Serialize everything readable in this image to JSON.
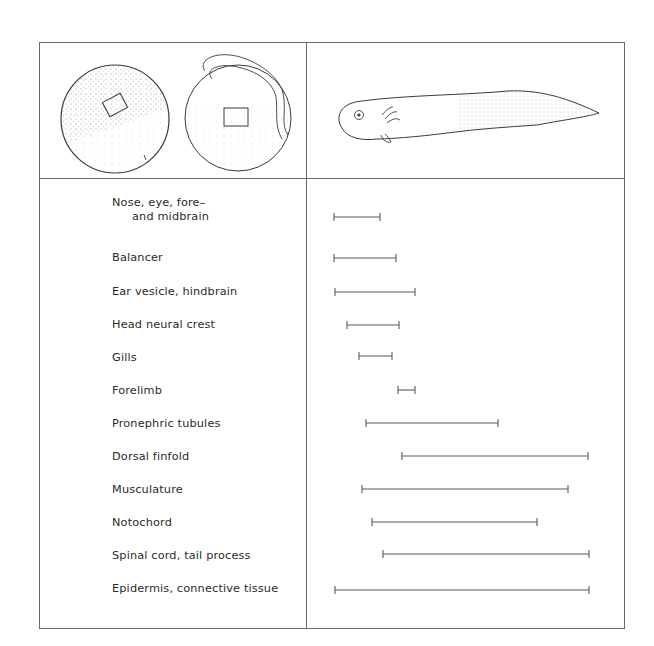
{
  "figure": {
    "top_left_panel": {
      "description": "Two embryo spheres (early gastrula and neurula) each with a marked rectangular region",
      "embryo_1": "early-gastrula-sphere",
      "embryo_2": "neurula-sphere"
    },
    "top_right_panel": {
      "description": "Tadpole larva in side view",
      "larva": "tadpole-larva"
    }
  },
  "rows": [
    {
      "label_line1": "Nose, eye, fore–",
      "label_line2": "and midbrain",
      "start": 334,
      "end": 380,
      "y": 217
    },
    {
      "label_line1": "Balancer",
      "label_line2": "",
      "start": 334,
      "end": 396,
      "y": 258
    },
    {
      "label_line1": "Ear vesicle, hindbrain",
      "label_line2": "",
      "start": 335,
      "end": 415,
      "y": 292
    },
    {
      "label_line1": "Head neural crest",
      "label_line2": "",
      "start": 347,
      "end": 399,
      "y": 325
    },
    {
      "label_line1": "Gills",
      "label_line2": "",
      "start": 359,
      "end": 392,
      "y": 356
    },
    {
      "label_line1": "Forelimb",
      "label_line2": "",
      "start": 398,
      "end": 415,
      "y": 390
    },
    {
      "label_line1": "Pronephric tubules",
      "label_line2": "",
      "start": 366,
      "end": 498,
      "y": 423
    },
    {
      "label_line1": "Dorsal finfold",
      "label_line2": "",
      "start": 402,
      "end": 588,
      "y": 456
    },
    {
      "label_line1": "Musculature",
      "label_line2": "",
      "start": 362,
      "end": 568,
      "y": 489
    },
    {
      "label_line1": "Notochord",
      "label_line2": "",
      "start": 372,
      "end": 537,
      "y": 522
    },
    {
      "label_line1": "Spinal cord, tail process",
      "label_line2": "",
      "start": 383,
      "end": 589,
      "y": 554
    },
    {
      "label_line1": "Epidermis, connective tissue",
      "label_line2": "",
      "start": 335,
      "end": 589,
      "y": 590
    }
  ],
  "colors": {
    "line": "#6a6a6a",
    "bar": "#5a5a5a",
    "text": "#2a2a2a",
    "stipple": "#9a9a9a"
  }
}
